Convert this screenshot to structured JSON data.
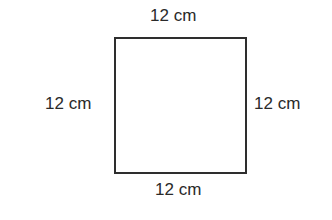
{
  "diagram": {
    "shape": "square",
    "stroke_color": "#2e2e2e",
    "labels": {
      "top": "12 cm",
      "left": "12 cm",
      "right": "12 cm",
      "bottom": "12 cm"
    }
  }
}
